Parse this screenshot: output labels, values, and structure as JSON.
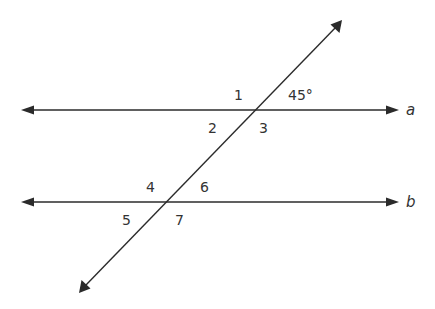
{
  "diagram": {
    "lines": [
      {
        "id": "a",
        "label": "a"
      },
      {
        "id": "b",
        "label": "b"
      }
    ],
    "angles_at_a": {
      "top_left": "1",
      "top_right": "45°",
      "bottom_left": "2",
      "bottom_right": "3"
    },
    "angles_at_b": {
      "top_left": "4",
      "top_right": "6",
      "bottom_left": "5",
      "bottom_right": "7"
    },
    "colors": {
      "stroke": "#2b2b2b",
      "text": "#333333",
      "background": "#ffffff"
    }
  }
}
